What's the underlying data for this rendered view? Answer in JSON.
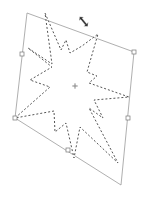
{
  "canvas": {
    "width": 148,
    "height": 197,
    "background": "#ffffff"
  },
  "transform_box": {
    "stroke": "#9a9a9a",
    "corners": [
      [
        27,
        13
      ],
      [
        134,
        52
      ],
      [
        121,
        185
      ],
      [
        15,
        118
      ]
    ],
    "top_edge": [
      [
        67,
        13
      ],
      [
        134,
        52
      ]
    ],
    "handles": [
      {
        "name": "handle-left-middle",
        "x": 22,
        "y": 54
      },
      {
        "name": "handle-top-right",
        "x": 134,
        "y": 52
      },
      {
        "name": "handle-right-middle",
        "x": 128,
        "y": 118
      },
      {
        "name": "handle-bottom-left",
        "x": 15,
        "y": 118
      },
      {
        "name": "handle-bottom-middle",
        "x": 68,
        "y": 150
      }
    ],
    "center": {
      "x": 75,
      "y": 86
    }
  },
  "selection": {
    "shape": "star",
    "stroke": "#555555",
    "style": "marching-ants dashed",
    "points": [
      [
        45,
        13
      ],
      [
        61,
        50
      ],
      [
        66,
        40
      ],
      [
        70,
        53
      ],
      [
        82,
        46
      ],
      [
        98,
        34
      ],
      [
        87,
        72
      ],
      [
        97,
        76
      ],
      [
        89,
        83
      ],
      [
        129,
        97
      ],
      [
        94,
        100
      ],
      [
        103,
        118
      ],
      [
        89,
        108
      ],
      [
        118,
        163
      ],
      [
        80,
        127
      ],
      [
        74,
        158
      ],
      [
        66,
        123
      ],
      [
        55,
        132
      ],
      [
        54,
        111
      ],
      [
        15,
        118
      ],
      [
        50,
        87
      ],
      [
        30,
        80
      ],
      [
        52,
        67
      ],
      [
        28,
        48
      ],
      [
        52,
        64
      ]
    ]
  },
  "cursor": {
    "type": "rotate-arrow",
    "x": 84,
    "y": 22,
    "color": "#333333"
  }
}
